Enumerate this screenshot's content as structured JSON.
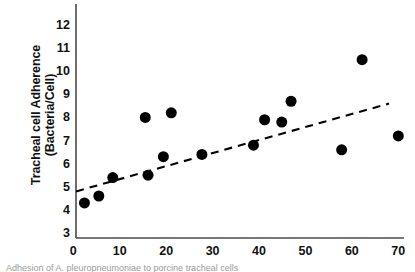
{
  "figure": {
    "background_color": "#ffffff",
    "axis_color": "#4a4a4a",
    "marker_color": "#000000",
    "trendline_color": "#000000"
  },
  "caption_sliver": "Adhesion of A. pleuropneumoniae to porcine tracheal cells",
  "chart_data": {
    "type": "scatter",
    "title": "",
    "xlabel": "",
    "ylabel": "Tracheal cell Adherence (Bacteria/Cell)",
    "ylabel_lines": [
      "Tracheal cell Adherence",
      "(Bacteria/Cell)"
    ],
    "xlim": [
      0,
      72
    ],
    "ylim": [
      3,
      12.4
    ],
    "xticks": [
      0,
      10,
      20,
      30,
      40,
      50,
      60,
      70
    ],
    "xticklabels": [
      "0",
      "10",
      "20",
      "30",
      "40",
      "50",
      "60",
      "70"
    ],
    "yticks": [
      3,
      4,
      5,
      6,
      7,
      8,
      9,
      10,
      11,
      12
    ],
    "yticklabels": [
      "3",
      "4",
      "5",
      "6",
      "7",
      "8",
      "9",
      "10",
      "11",
      "12"
    ],
    "grid": false,
    "legend": null,
    "marker": "filled-circle",
    "marker_size_px": 11,
    "points": [
      {
        "x": 2.4,
        "y": 4.3
      },
      {
        "x": 5.5,
        "y": 4.6
      },
      {
        "x": 8.5,
        "y": 5.4
      },
      {
        "x": 15.5,
        "y": 8.0
      },
      {
        "x": 16.1,
        "y": 5.5
      },
      {
        "x": 19.4,
        "y": 6.3
      },
      {
        "x": 21.1,
        "y": 8.2
      },
      {
        "x": 27.7,
        "y": 6.4
      },
      {
        "x": 38.8,
        "y": 6.8
      },
      {
        "x": 41.2,
        "y": 7.9
      },
      {
        "x": 44.9,
        "y": 7.8
      },
      {
        "x": 46.9,
        "y": 8.7
      },
      {
        "x": 57.8,
        "y": 6.6
      },
      {
        "x": 62.2,
        "y": 10.5
      },
      {
        "x": 70.0,
        "y": 7.2
      }
    ],
    "trendline": {
      "style": "dashed",
      "x_start": 0.6,
      "y_start": 4.8,
      "x_end": 68.0,
      "y_end": 8.6
    }
  }
}
